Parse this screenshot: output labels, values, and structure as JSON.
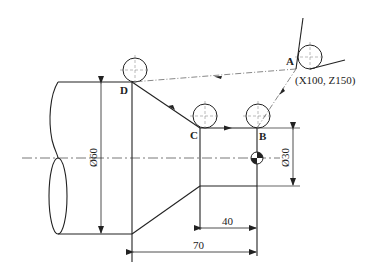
{
  "diagram": {
    "type": "CNC lathe turning tool path",
    "points": {
      "A": {
        "label": "A",
        "coord_label": "(X100, Z150)"
      },
      "B": {
        "label": "B"
      },
      "C": {
        "label": "C"
      },
      "D": {
        "label": "D"
      }
    },
    "dimensions": {
      "large_diameter": "Ø60",
      "small_diameter": "Ø30",
      "small_length": "40",
      "total_length": "70"
    },
    "colors": {
      "line": "#222222",
      "centerline": "#555555"
    }
  }
}
